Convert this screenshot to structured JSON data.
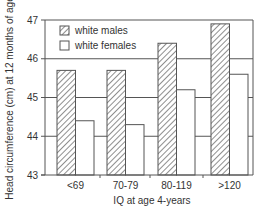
{
  "chart_data": {
    "type": "bar",
    "title": "",
    "xlabel": "IQ at age 4-years",
    "ylabel": "Head circumference (cm) at 12 months of age",
    "categories": [
      "<69",
      "70-79",
      "80-119",
      ">120"
    ],
    "series": [
      {
        "name": "white males",
        "pattern": "hatched",
        "values": [
          45.7,
          45.7,
          46.4,
          46.9
        ]
      },
      {
        "name": "white females",
        "pattern": "open",
        "values": [
          44.4,
          44.3,
          45.2,
          45.6
        ]
      }
    ],
    "ylim": [
      43,
      47
    ],
    "yticks": [
      43,
      44,
      45,
      46,
      47
    ],
    "grid": true,
    "legend_position": "upper-left-inside"
  },
  "colors": {
    "line": "#555555",
    "hatch": "#444444",
    "background": "#ffffff"
  }
}
